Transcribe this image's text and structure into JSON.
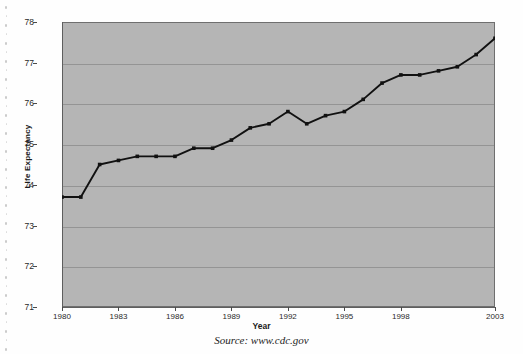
{
  "chart_data": {
    "type": "line",
    "title": "",
    "xlabel": "Year",
    "ylabel": "Life Expectancy",
    "ylim": [
      71,
      78
    ],
    "xlim": [
      1980,
      2003
    ],
    "ytick_labels": [
      "78",
      "77",
      "76",
      "75",
      "74",
      "73",
      "72",
      "71"
    ],
    "ytick_values": [
      78,
      77,
      76,
      75,
      74,
      73,
      72,
      71
    ],
    "xtick_labels": [
      "1980",
      "1983",
      "1986",
      "1989",
      "1992",
      "1995",
      "1998",
      "2003"
    ],
    "xtick_values": [
      1980,
      1983,
      1986,
      1989,
      1992,
      1995,
      1998,
      2003
    ],
    "grid": "horizontal",
    "legend": "none",
    "x": [
      1980,
      1981,
      1982,
      1983,
      1984,
      1985,
      1986,
      1987,
      1988,
      1989,
      1990,
      1991,
      1992,
      1993,
      1994,
      1995,
      1996,
      1997,
      1998,
      1999,
      2000,
      2001,
      2002,
      2003
    ],
    "values": [
      73.7,
      73.7,
      74.5,
      74.6,
      74.7,
      74.7,
      74.7,
      74.9,
      74.9,
      75.1,
      75.4,
      75.5,
      75.8,
      75.5,
      75.7,
      75.8,
      76.1,
      76.5,
      76.7,
      76.7,
      76.8,
      76.9,
      77.2,
      77.6
    ],
    "series_name": "Life Expectancy",
    "marker": "square",
    "line_color": "#111111",
    "marker_color": "#111111",
    "plot_background": "#b5b5b5",
    "gridline_color": "#8e8e8e"
  },
  "caption": {
    "source_text": "Source:  www.cdc.gov"
  },
  "axes": {
    "y_title": "Life Expectancy",
    "x_title": "Year"
  }
}
